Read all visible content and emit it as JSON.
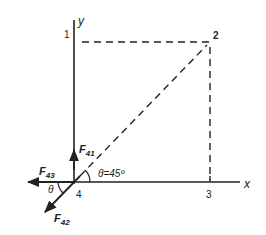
{
  "diagram": {
    "type": "free-body force diagram",
    "colors": {
      "line": "#222222",
      "background": "#ffffff"
    },
    "axes": {
      "x_label": "x",
      "y_label": "y"
    },
    "points": [
      {
        "id": "1",
        "label": "1"
      },
      {
        "id": "2",
        "label": "2"
      },
      {
        "id": "3",
        "label": "3"
      },
      {
        "id": "4",
        "label": "4"
      }
    ],
    "forces": [
      {
        "name": "F41",
        "main": "F",
        "sub": "41",
        "direction": "up (+y)"
      },
      {
        "name": "F42",
        "main": "F",
        "sub": "42",
        "direction": "down-left along 2→4 line"
      },
      {
        "name": "F43",
        "main": "F",
        "sub": "43",
        "direction": "left (-x)"
      }
    ],
    "angles": [
      {
        "label": "θ=45º",
        "location": "between x-axis and dashed diagonal at point 4"
      },
      {
        "label": "θ",
        "location": "between -x axis and F42"
      }
    ],
    "dashed_lines": [
      "1 → 2 (horizontal)",
      "2 → 3 (vertical)",
      "4 → 2 (diagonal)"
    ]
  }
}
